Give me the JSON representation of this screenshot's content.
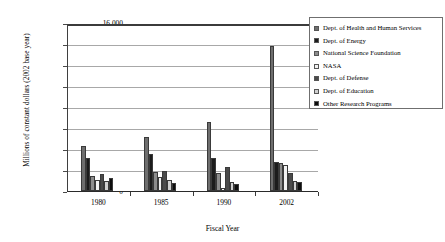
{
  "chart_data": {
    "type": "bar",
    "title": "",
    "xlabel": "Fiscal Year",
    "ylabel": "Millions of constant dollars (2002 base year)",
    "categories": [
      "1980",
      "1985",
      "1990",
      "2002"
    ],
    "ylim": [
      0,
      16000
    ],
    "ytick_labels": [
      "16,000",
      "14,000",
      "12,000",
      "10,000",
      "8,000",
      "6,000",
      "4,000",
      "2,000",
      "0"
    ],
    "ytick_values": [
      16000,
      14000,
      12000,
      10000,
      8000,
      6000,
      4000,
      2000,
      0
    ],
    "grid": true,
    "legend_position": "right",
    "series": [
      {
        "name": "Dept. of Health and Human Services",
        "color": "#6e6e6e",
        "values": [
          4300,
          5100,
          6550,
          13800
        ]
      },
      {
        "name": "Dept. of Energy",
        "color": "#1c1c1c",
        "values": [
          3100,
          3500,
          3150,
          2800
        ]
      },
      {
        "name": "National Science Foundation",
        "color": "#8c8c8c",
        "values": [
          1450,
          1800,
          1750,
          2700
        ]
      },
      {
        "name": "NASA",
        "color": "#f2f2f2",
        "values": [
          1050,
          1300,
          250,
          2500
        ]
      },
      {
        "name": "Dept. of Defense",
        "color": "#4a4a4a",
        "values": [
          1650,
          1900,
          2250,
          1700
        ]
      },
      {
        "name": "Dept. of Education",
        "color": "#d0d0d0",
        "values": [
          950,
          1050,
          900,
          1000
        ]
      },
      {
        "name": "Other Research Programs",
        "color": "#0d0d0d",
        "values": [
          1250,
          800,
          700,
          900
        ]
      }
    ]
  },
  "legend": {
    "items": [
      {
        "label": "Dept. of Health and Human Services",
        "color": "#6e6e6e"
      },
      {
        "label": "Dept. of Energy",
        "color": "#1c1c1c"
      },
      {
        "label": "National Science Foundation",
        "color": "#8c8c8c"
      },
      {
        "label": "NASA",
        "color": "#f2f2f2"
      },
      {
        "label": "Dept. of Defense",
        "color": "#4a4a4a"
      },
      {
        "label": "Dept. of Education",
        "color": "#d0d0d0"
      },
      {
        "label": "Other Research Programs",
        "color": "#0d0d0d"
      }
    ]
  }
}
